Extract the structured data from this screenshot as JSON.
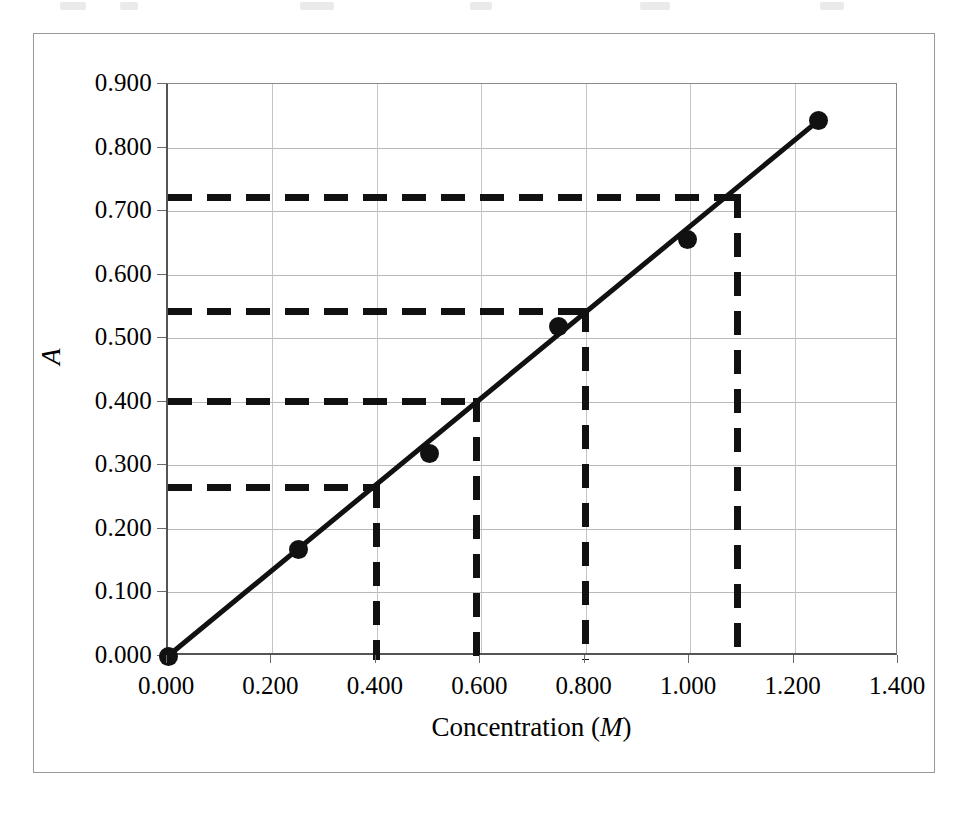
{
  "figure": {
    "kind": "scientific-plot",
    "background_color": "#ffffff",
    "frame_color": "#9a9a9a",
    "ink_color": "#111111",
    "gridline_color": "#b9b9b9"
  },
  "axes": {
    "x": {
      "title_prefix": "Concentration (",
      "title_italic": "M",
      "title_suffix": ")",
      "title_full": "Concentration (M)",
      "ticks": [
        "0.000",
        "0.200",
        "0.400",
        "0.600",
        "0.800",
        "1.000",
        "1.200",
        "1.400"
      ],
      "tick_values": [
        0.0,
        0.2,
        0.4,
        0.6,
        0.8,
        1.0,
        1.2,
        1.4
      ],
      "min": 0.0,
      "max": 1.4
    },
    "y": {
      "title_full": "A",
      "ticks": [
        "0.000",
        "0.100",
        "0.200",
        "0.300",
        "0.400",
        "0.500",
        "0.600",
        "0.700",
        "0.800",
        "0.900"
      ],
      "tick_values": [
        0.0,
        0.1,
        0.2,
        0.3,
        0.4,
        0.5,
        0.6,
        0.7,
        0.8,
        0.9
      ],
      "min": 0.0,
      "max": 0.9
    }
  },
  "chart_data": {
    "type": "scatter",
    "title": "",
    "subtitle": "",
    "xlabel": "Concentration (M)",
    "ylabel": "A",
    "xlim": [
      0.0,
      1.4
    ],
    "ylim": [
      0.0,
      0.9
    ],
    "xticks": [
      0.0,
      0.2,
      0.4,
      0.6,
      0.8,
      1.0,
      1.2,
      1.4
    ],
    "yticks": [
      0.0,
      0.1,
      0.2,
      0.3,
      0.4,
      0.5,
      0.6,
      0.7,
      0.8,
      0.9
    ],
    "grid": true,
    "grid_axis": "both",
    "legend": false,
    "legend_position": "none",
    "series": [
      {
        "name": "Standards",
        "marker": "filled-circle",
        "marker_color": "#111111",
        "line": "solid",
        "line_color": "#111111",
        "x": [
          0.0,
          0.25,
          0.5,
          0.748,
          0.995,
          1.245
        ],
        "y": [
          0.0,
          0.167,
          0.318,
          0.518,
          0.655,
          0.842
        ]
      }
    ],
    "fit_line": {
      "name": "Best-fit line through origin",
      "style": "solid",
      "color": "#111111",
      "x": [
        0.0,
        1.245
      ],
      "y": [
        0.0,
        0.842
      ],
      "slope": 0.676,
      "intercept": 0.0
    },
    "annotations": [
      {
        "name": "readout-1",
        "style": "dashed",
        "color": "#111111",
        "absorbance": 0.265,
        "concentration": 0.4,
        "path": "horizontal from y-axis at A=0.265 to line, then vertical down to x-axis at C=0.400"
      },
      {
        "name": "readout-2",
        "style": "dashed",
        "color": "#111111",
        "absorbance": 0.4,
        "concentration": 0.59,
        "path": "horizontal from y-axis at A=0.400 to line, then vertical down to x-axis at C=0.590"
      },
      {
        "name": "readout-3",
        "style": "dashed",
        "color": "#111111",
        "absorbance": 0.542,
        "concentration": 0.8,
        "path": "horizontal from y-axis at A=0.542 to line, then vertical down to x-axis at C=0.800"
      },
      {
        "name": "readout-4",
        "style": "dashed",
        "color": "#111111",
        "absorbance": 0.722,
        "concentration": 1.09,
        "path": "horizontal from y-axis at A=0.722 to line, then vertical down to x-axis at C=1.090"
      }
    ]
  }
}
